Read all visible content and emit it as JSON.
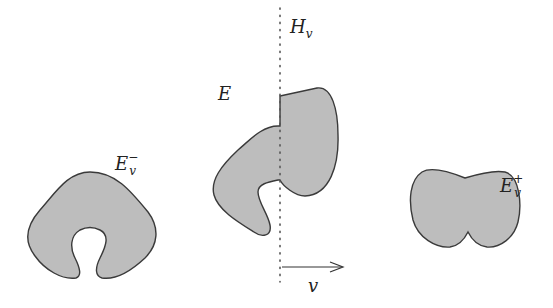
{
  "figure": {
    "labels": {
      "left_set": {
        "base": "E",
        "sub": "v",
        "sup": "−"
      },
      "middle_set": {
        "base": "E"
      },
      "hyperplane": {
        "base": "H",
        "sub": "v"
      },
      "right_set": {
        "base": "E",
        "sub": "v",
        "sup": "+"
      },
      "direction": {
        "base": "v"
      }
    },
    "colors": {
      "fill": "#bdbdbd",
      "stroke": "#3a3a3a",
      "dotted_line": "#555555"
    }
  }
}
